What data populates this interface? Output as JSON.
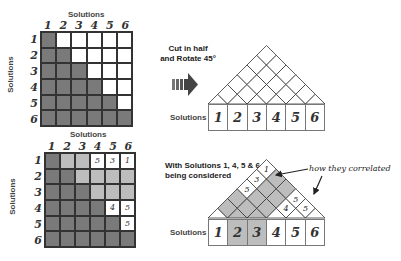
{
  "top_matrix": {
    "title": "Solutions",
    "row_axis_label": "Solutions",
    "col_labels": [
      "1",
      "2",
      "3",
      "4",
      "5",
      "6"
    ],
    "row_labels": [
      "1",
      "2",
      "3",
      "4",
      "5",
      "6"
    ],
    "colors": {
      "dark": "#7a7a7a",
      "white": "#ffffff"
    }
  },
  "bottom_matrix": {
    "title": "Solutions",
    "row_axis_label": "Solutions",
    "col_labels": [
      "1",
      "2",
      "3",
      "4",
      "5",
      "6"
    ],
    "row_labels": [
      "1",
      "2",
      "3",
      "4",
      "5",
      "6"
    ],
    "cell_values": {
      "1-4": "5",
      "1-5": "3",
      "1-6": "1",
      "4-5": "4",
      "4-6": "5",
      "5-6": "5"
    },
    "colors": {
      "dark": "#7a7a7a",
      "light": "#bdbdbd",
      "white": "#ffffff"
    }
  },
  "transform": {
    "caption_line1": "Cut in half",
    "caption_line2": "and Rotate 45°",
    "arrow_icon": "right-arrow"
  },
  "top_triangle": {
    "row_label": "Solutions",
    "solutions": [
      "1",
      "2",
      "3",
      "4",
      "5",
      "6"
    ]
  },
  "bottom_triangle": {
    "caption_line1": "With Solutions 1, 4, 5 & 6",
    "caption_line2": "being considered",
    "annotation": "how they correlated",
    "row_label": "Solutions",
    "solutions": [
      "1",
      "2",
      "3",
      "4",
      "5",
      "6"
    ],
    "highlighted_solutions": [
      "2",
      "3"
    ],
    "considered_solutions": [
      "1",
      "4",
      "5",
      "6"
    ],
    "cell_values": {
      "1-4": "5",
      "1-5": "3",
      "1-6": "1",
      "4-5": "4",
      "4-6": "5",
      "5-6": "5"
    },
    "colors": {
      "shaded": "#bdbdbd",
      "white": "#ffffff"
    }
  }
}
